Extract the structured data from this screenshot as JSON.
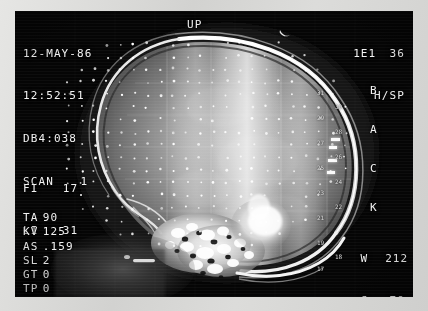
{
  "display": {
    "device": "CT scanner console",
    "view": "lateral skull scanogram",
    "border_color": "#d8d8d6",
    "screen_color": "#000000",
    "text_color": "#f2f2f2"
  },
  "header_left": {
    "date": "12-MAY-86",
    "time": "12:52:51",
    "study_id": "DB4:038",
    "scan_label": "SCAN",
    "scan_number": "1"
  },
  "orientation": {
    "up_label": "UP",
    "back_label": "BACK",
    "back_letters": [
      "B",
      "A",
      "C",
      "K"
    ],
    "marker_icon": "crescent-marker-icon"
  },
  "header_right": {
    "mode_code": "1E1",
    "mode_value": "36",
    "protocol": "H/SP"
  },
  "image_index": {
    "first_image_key": "FI",
    "first_image_value": "17",
    "last_image_key": "LI",
    "last_image_value": "31"
  },
  "technique": [
    {
      "key": "TA",
      "value": "90"
    },
    {
      "key": "KV",
      "value": "125"
    },
    {
      "key": "AS",
      "value": ".159"
    },
    {
      "key": "SL",
      "value": "2"
    },
    {
      "key": "GT",
      "value": "0"
    },
    {
      "key": "TP",
      "value": "0"
    }
  ],
  "window": {
    "width_label": "W",
    "width_value": "212",
    "center_label": "C",
    "center_value": "70"
  },
  "slice_scale": {
    "orientation": "vertical",
    "description": "slice position index descending down the posterior skull margin",
    "ticks": [
      {
        "label": "31",
        "column": "A",
        "top": 0
      },
      {
        "label": "30",
        "column": "B",
        "top": 14
      },
      {
        "label": "29",
        "column": "A",
        "top": 25
      },
      {
        "label": "28",
        "column": "B",
        "top": 39
      },
      {
        "label": "27",
        "column": "A",
        "top": 50
      },
      {
        "label": "26",
        "column": "B",
        "top": 64
      },
      {
        "label": "25",
        "column": "A",
        "top": 75
      },
      {
        "label": "24",
        "column": "B",
        "top": 89
      },
      {
        "label": "23",
        "column": "A",
        "top": 100
      },
      {
        "label": "22",
        "column": "B",
        "top": 114
      },
      {
        "label": "21",
        "column": "A",
        "top": 125
      },
      {
        "label": "19",
        "column": "A",
        "top": 150
      },
      {
        "label": "18",
        "column": "B",
        "top": 164
      },
      {
        "label": "17",
        "column": "A",
        "top": 176
      }
    ]
  }
}
